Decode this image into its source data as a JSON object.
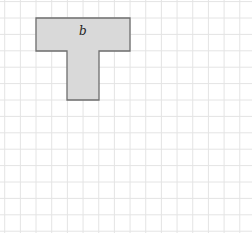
{
  "figure": {
    "grid": {
      "columns": 16,
      "rows": 14,
      "line_color": "#e4e4e4",
      "background": "#ffffff"
    },
    "shape": {
      "name": "T-shape",
      "label": "b",
      "fill": "#d9d9d9",
      "stroke": "#6e6e6e",
      "cells": {
        "top_bar": {
          "col_start": 2,
          "col_end": 8,
          "row_start": 1,
          "row_end": 3
        },
        "stem": {
          "col_start": 4,
          "col_end": 6,
          "row_start": 3,
          "row_end": 6
        }
      },
      "area_units": 18
    }
  }
}
